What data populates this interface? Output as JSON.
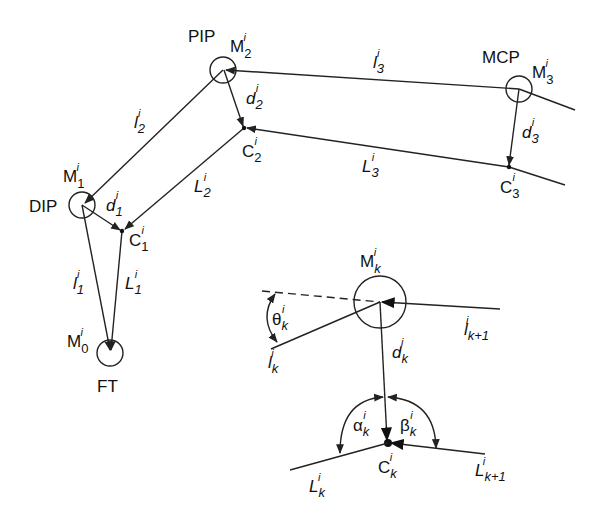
{
  "joints": {
    "pip": "PIP",
    "mcp": "MCP",
    "dip": "DIP",
    "ft": "FT"
  },
  "markers": {
    "M": "M",
    "C": "C",
    "l": "l",
    "L": "L",
    "d": "d",
    "theta": "θ",
    "alpha": "α",
    "beta": "β",
    "sup": "i",
    "sub0": "0",
    "sub1": "1",
    "sub2": "2",
    "sub3": "3",
    "subk": "k",
    "subk1": "k+1"
  },
  "colors": {
    "stroke": "#222222",
    "background": "#ffffff"
  }
}
